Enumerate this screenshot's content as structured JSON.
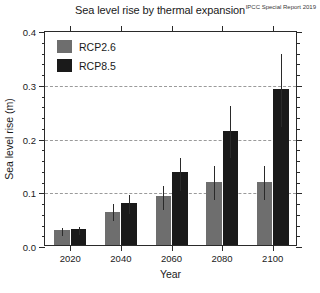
{
  "chart_data": {
    "type": "bar",
    "title": "Sea level rise by thermal expansion",
    "xlabel": "Year",
    "ylabel": "Sea level rise (m)",
    "categories": [
      "2020",
      "2040",
      "2060",
      "2080",
      "2100"
    ],
    "ylim": [
      0.0,
      0.4
    ],
    "ytick_labels": [
      "0.0",
      "0.1",
      "0.2",
      "0.3",
      "0.4"
    ],
    "ytick_values": [
      0.0,
      0.1,
      0.2,
      0.3,
      0.4
    ],
    "yminor_step": 0.02,
    "grid": "horizontal dashed gridlines at 0.1, 0.2, 0.3",
    "legend_position": "top-left inside axes",
    "annotation": "IPCC Special Report 2019",
    "series": [
      {
        "name": "RCP2.6",
        "color": "#6e6e6e",
        "values": [
          0.028,
          0.062,
          0.091,
          0.118,
          0.118
        ],
        "err_low": [
          0.02,
          0.048,
          0.068,
          0.088,
          0.088
        ],
        "err_high": [
          0.036,
          0.08,
          0.113,
          0.151,
          0.151
        ]
      },
      {
        "name": "RCP8.5",
        "color": "#1a1a1a",
        "values": [
          0.03,
          0.079,
          0.135,
          0.213,
          0.291
        ],
        "err_low": [
          0.022,
          0.062,
          0.104,
          0.165,
          0.224
        ],
        "err_high": [
          0.038,
          0.097,
          0.166,
          0.262,
          0.359
        ]
      }
    ]
  }
}
